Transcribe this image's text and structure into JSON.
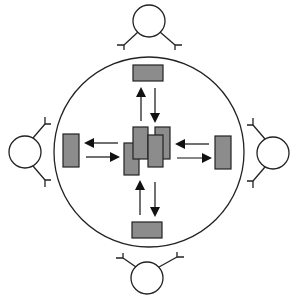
{
  "diagram": {
    "title": "",
    "colors": {
      "stroke": "#222222",
      "fill_box": "#8c8c8c",
      "fill_circle": "#ffffff",
      "arrow": "#111111",
      "background": "#ffffff"
    },
    "outer_circle": {
      "cx": 149,
      "cy": 152,
      "r": 95
    },
    "center_boxes": [
      {
        "x": 124,
        "y": 143,
        "w": 15,
        "h": 32
      },
      {
        "x": 155,
        "y": 127,
        "w": 15,
        "h": 32
      },
      {
        "x": 133,
        "y": 127,
        "w": 15,
        "h": 32
      },
      {
        "x": 148,
        "y": 135,
        "w": 15,
        "h": 32
      }
    ],
    "peripheral_boxes": [
      {
        "id": "top",
        "x": 133,
        "y": 65,
        "w": 30,
        "h": 16
      },
      {
        "id": "bottom",
        "x": 132,
        "y": 222,
        "w": 30,
        "h": 16
      },
      {
        "id": "left",
        "x": 63,
        "y": 134,
        "w": 16,
        "h": 33
      },
      {
        "id": "right",
        "x": 215,
        "y": 136,
        "w": 16,
        "h": 33
      }
    ],
    "arrows": [
      {
        "id": "top-out",
        "x1": 141,
        "y1": 121,
        "x2": 141,
        "y2": 89
      },
      {
        "id": "top-in",
        "x1": 155,
        "y1": 88,
        "x2": 155,
        "y2": 121
      },
      {
        "id": "bottom-out",
        "x1": 140,
        "y1": 215,
        "x2": 140,
        "y2": 182
      },
      {
        "id": "bottom-in",
        "x1": 155,
        "y1": 182,
        "x2": 155,
        "y2": 215
      },
      {
        "id": "left-out",
        "x1": 118,
        "y1": 143,
        "x2": 86,
        "y2": 143
      },
      {
        "id": "left-in",
        "x1": 86,
        "y1": 157,
        "x2": 118,
        "y2": 157
      },
      {
        "id": "right-out",
        "x1": 177,
        "y1": 158,
        "x2": 210,
        "y2": 158
      },
      {
        "id": "right-in",
        "x1": 209,
        "y1": 144,
        "x2": 177,
        "y2": 144
      }
    ],
    "agents": [
      {
        "id": "top",
        "cx": 149,
        "cy": 21,
        "r": 16,
        "arms": [
          {
            "from": [
              138,
              32
            ],
            "to": [
              124,
              45
            ],
            "tip": [
              117,
              45,
              124,
              45,
              124,
              50
            ]
          },
          {
            "from": [
              160,
              32
            ],
            "to": [
              175,
              45
            ],
            "tip": [
              182,
              45,
              175,
              45,
              175,
              50
            ]
          }
        ]
      },
      {
        "id": "bottom",
        "cx": 147,
        "cy": 278,
        "r": 16,
        "arms": [
          {
            "from": [
              136,
              267
            ],
            "to": [
              123,
              258
            ],
            "tip": [
              116,
              258,
              123,
              258,
              123,
              253
            ]
          },
          {
            "from": [
              159,
              267
            ],
            "to": [
              177,
              257
            ],
            "tip": [
              184,
              257,
              177,
              257,
              177,
              252
            ]
          }
        ]
      },
      {
        "id": "left",
        "cx": 25,
        "cy": 152,
        "r": 16,
        "arms": [
          {
            "from": [
              33,
              138
            ],
            "to": [
              45,
              124
            ],
            "tip": [
              45,
              117,
              45,
              124,
              51,
              124
            ]
          },
          {
            "from": [
              33,
              166
            ],
            "to": [
              45,
              180
            ],
            "tip": [
              45,
              187,
              45,
              180,
              51,
              180
            ]
          }
        ]
      },
      {
        "id": "right",
        "cx": 273,
        "cy": 153,
        "r": 16,
        "arms": [
          {
            "from": [
              265,
              139
            ],
            "to": [
              253,
              125
            ],
            "tip": [
              253,
              118,
              253,
              125,
              247,
              125
            ]
          },
          {
            "from": [
              265,
              167
            ],
            "to": [
              253,
              181
            ],
            "tip": [
              253,
              188,
              253,
              181,
              247,
              181
            ]
          }
        ]
      }
    ]
  }
}
